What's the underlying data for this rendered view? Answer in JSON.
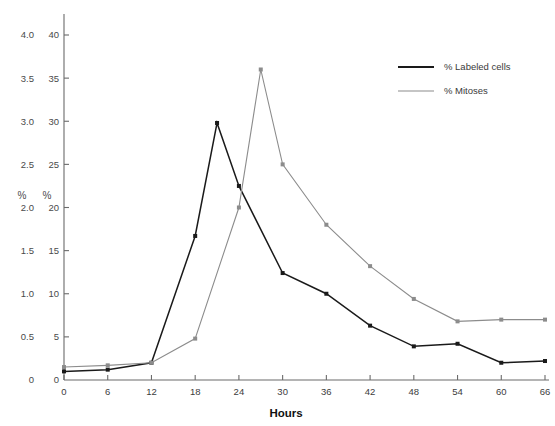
{
  "chart_data": {
    "type": "line",
    "title": "",
    "subtitle": "",
    "xlabel": "Hours",
    "ylabel": "%",
    "ylabel_secondary": "%",
    "grid": false,
    "legend_position": "top-right",
    "x": [
      0,
      6,
      12,
      18,
      21,
      24,
      27,
      30,
      36,
      42,
      48,
      54,
      60,
      66
    ],
    "xlim": [
      0,
      66
    ],
    "xticks": [
      0,
      6,
      12,
      18,
      24,
      30,
      36,
      42,
      48,
      54,
      60,
      66
    ],
    "xtick_labels": [
      "0",
      "6",
      "12",
      "18",
      "24",
      "30",
      "36",
      "42",
      "48",
      "54",
      "60",
      "66"
    ],
    "ylim_left": [
      0,
      4.0
    ],
    "yticks_left": [
      0,
      0.5,
      1.0,
      1.5,
      2.0,
      2.5,
      3.0,
      3.5,
      4.0
    ],
    "ytick_labels_left": [
      "0",
      "0.5",
      "1.0",
      "1.5",
      "2.0",
      "2.5",
      "3.0",
      "3.5",
      "4.0"
    ],
    "ylim_right": [
      0,
      40
    ],
    "yticks_right": [
      0,
      5,
      10,
      15,
      20,
      25,
      30,
      35,
      40
    ],
    "ytick_labels_right": [
      "0",
      "5",
      "10",
      "15",
      "20",
      "25",
      "30",
      "35",
      "40"
    ],
    "series": [
      {
        "name": "% Labeled cells",
        "color": "#1a1a1a",
        "axis": "left",
        "marker": "square",
        "x": [
          0,
          6,
          12,
          18,
          21,
          24,
          30,
          36,
          42,
          48,
          54,
          60,
          66
        ],
        "values": [
          0.1,
          0.12,
          0.2,
          1.67,
          2.98,
          2.25,
          1.24,
          1.0,
          0.63,
          0.39,
          0.42,
          0.2,
          0.22
        ]
      },
      {
        "name": "% Mitoses",
        "color": "#8c8c8c",
        "axis": "right",
        "marker": "square",
        "x": [
          0,
          6,
          12,
          18,
          24,
          27,
          30,
          36,
          42,
          48,
          54,
          60,
          66
        ],
        "values": [
          1.5,
          1.7,
          2.0,
          4.8,
          20.0,
          36.0,
          25.0,
          18.0,
          13.2,
          9.4,
          6.8,
          7.0,
          7.0
        ]
      }
    ],
    "legend": [
      {
        "label": "% Labeled cells",
        "color": "#1a1a1a"
      },
      {
        "label": "% Mitoses",
        "color": "#8c8c8c"
      }
    ]
  }
}
